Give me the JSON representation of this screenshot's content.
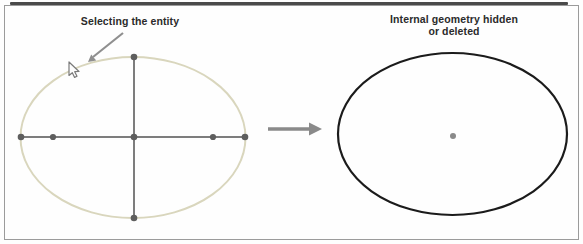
{
  "diagram": {
    "left_panel": {
      "caption": "Selecting the entity",
      "colors": {
        "selected_ellipse": "#d9d6bd",
        "axis_line": "#7d7d7d",
        "point": "#5e5e5e",
        "leader_arrow": "#8f8f8f"
      }
    },
    "right_panel": {
      "caption_line1": "Internal geometry hidden",
      "caption_line2": "or deleted",
      "colors": {
        "ellipse": "#1b1b1b",
        "center_point": "#8a8a8a"
      }
    },
    "transition": {
      "arrow_color": "#8a8a8a"
    },
    "frame": {
      "border_color": "#9b9b9b",
      "top_rule_color": "#4a4a4a"
    }
  }
}
